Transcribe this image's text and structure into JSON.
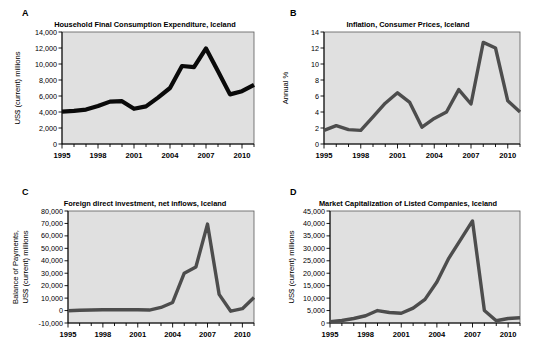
{
  "figure": {
    "background": "#ffffff",
    "plot_background": "#e0e0e0",
    "panels": [
      "A",
      "B",
      "C",
      "D"
    ]
  },
  "panels": {
    "a": {
      "letter": "A",
      "title": "Household Final Consumption Expenditure, Iceland",
      "ylabel": "US$ (current) millions",
      "line_color": "#0a0a0a"
    },
    "b": {
      "letter": "B",
      "title": "Inflation, Consumer Prices, Iceland",
      "ylabel": "Annual %",
      "line_color": "#4d4d4d"
    },
    "c": {
      "letter": "C",
      "title": "Foreign direct investment, net inflows, Iceland",
      "ylabel_line1": "Balance of Payments,",
      "ylabel_line2": "US$ (current) millions",
      "line_color": "#4d4d4d"
    },
    "d": {
      "letter": "D",
      "title": "Market Capitalization of Listed Companies, Iceland",
      "ylabel": "US$ (current) millions",
      "line_color": "#4d4d4d"
    }
  },
  "chart_data": [
    {
      "panel": "A",
      "type": "line",
      "title": "Household Final Consumption Expenditure, Iceland",
      "xlabel": "",
      "ylabel": "US$ (current) millions",
      "x": [
        1995,
        1996,
        1997,
        1998,
        1999,
        2000,
        2001,
        2002,
        2003,
        2004,
        2005,
        2006,
        2007,
        2008,
        2009,
        2010,
        2011
      ],
      "values": [
        4050,
        4150,
        4300,
        4750,
        5300,
        5350,
        4400,
        4700,
        5800,
        7000,
        9750,
        9600,
        11950,
        9100,
        6200,
        6600,
        7400
      ],
      "xlim": [
        1995,
        2011
      ],
      "ylim": [
        0,
        14000
      ],
      "yticks": [
        0,
        2000,
        4000,
        6000,
        8000,
        10000,
        12000,
        14000
      ],
      "yticklabels": [
        "0",
        "2,000",
        "4,000",
        "6,000",
        "8,000",
        "10,000",
        "12,000",
        "14,000"
      ],
      "xticks": [
        1995,
        1998,
        2001,
        2004,
        2007,
        2010
      ],
      "xticklabels": [
        "1995",
        "1998",
        "2001",
        "2004",
        "2007",
        "2010"
      ],
      "grid": false,
      "legend": "none"
    },
    {
      "panel": "B",
      "type": "line",
      "title": "Inflation, Consumer Prices, Iceland",
      "xlabel": "",
      "ylabel": "Annual %",
      "x": [
        1995,
        1996,
        1997,
        1998,
        1999,
        2000,
        2001,
        2002,
        2003,
        2004,
        2005,
        2006,
        2007,
        2008,
        2009,
        2010,
        2011
      ],
      "values": [
        1.7,
        2.3,
        1.8,
        1.7,
        3.4,
        5.1,
        6.4,
        5.2,
        2.1,
        3.2,
        4.0,
        6.8,
        5.0,
        12.7,
        12.0,
        5.4,
        4.0
      ],
      "xlim": [
        1995,
        2011
      ],
      "ylim": [
        0,
        14
      ],
      "yticks": [
        0,
        2,
        4,
        6,
        8,
        10,
        12,
        14
      ],
      "yticklabels": [
        "0",
        "2",
        "4",
        "6",
        "8",
        "10",
        "12",
        "14"
      ],
      "xticks": [
        1995,
        1998,
        2001,
        2004,
        2007,
        2010
      ],
      "xticklabels": [
        "1995",
        "1998",
        "2001",
        "2004",
        "2007",
        "2010"
      ],
      "grid": false,
      "legend": "none"
    },
    {
      "panel": "C",
      "type": "line",
      "title": "Foreign direct investment, net inflows, Iceland",
      "xlabel": "",
      "ylabel": "Balance of Payments, US$ (current) millions",
      "x": [
        1995,
        1996,
        1997,
        1998,
        1999,
        2000,
        2001,
        2002,
        2003,
        2004,
        2005,
        2006,
        2007,
        2008,
        2009,
        2010,
        2011
      ],
      "values": [
        -100,
        300,
        400,
        600,
        700,
        700,
        700,
        400,
        2500,
        6500,
        30000,
        35000,
        69500,
        13000,
        -500,
        1500,
        10500
      ],
      "xlim": [
        1995,
        2011
      ],
      "ylim": [
        -10000,
        80000
      ],
      "yticks": [
        -10000,
        0,
        10000,
        20000,
        30000,
        40000,
        50000,
        60000,
        70000,
        80000
      ],
      "yticklabels": [
        "-10,000",
        "0",
        "10,000",
        "20,000",
        "30,000",
        "40,000",
        "50,000",
        "60,000",
        "70,000",
        "80,000"
      ],
      "xticks": [
        1995,
        1998,
        2001,
        2004,
        2007,
        2010
      ],
      "xticklabels": [
        "1995",
        "1998",
        "2001",
        "2004",
        "2007",
        "2010"
      ],
      "grid": false,
      "legend": "none"
    },
    {
      "panel": "D",
      "type": "line",
      "title": "Market Capitalization of Listed Companies, Iceland",
      "xlabel": "",
      "ylabel": "US$ (current) millions",
      "x": [
        1995,
        1996,
        1997,
        1998,
        1999,
        2000,
        2001,
        2002,
        2003,
        2004,
        2005,
        2006,
        2007,
        2008,
        2009,
        2010,
        2011
      ],
      "values": [
        500,
        1000,
        1800,
        2900,
        5000,
        4200,
        3900,
        6000,
        9500,
        16500,
        26000,
        33500,
        41000,
        5000,
        900,
        1800,
        2100
      ],
      "xlim": [
        1995,
        2011
      ],
      "ylim": [
        0,
        45000
      ],
      "yticks": [
        0,
        5000,
        10000,
        15000,
        20000,
        25000,
        30000,
        35000,
        40000,
        45000
      ],
      "yticklabels": [
        "0",
        "5,000",
        "10,000",
        "15,000",
        "20,000",
        "25,000",
        "30,000",
        "35,000",
        "40,000",
        "45,000"
      ],
      "xticks": [
        1995,
        1998,
        2001,
        2004,
        2007,
        2010
      ],
      "xticklabels": [
        "1995",
        "1998",
        "2001",
        "2004",
        "2007",
        "2010"
      ],
      "grid": false,
      "legend": "none"
    }
  ]
}
